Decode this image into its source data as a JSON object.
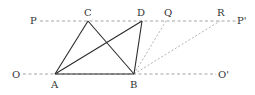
{
  "diagram": {
    "title": "",
    "colors": {
      "solid": "#2b2b2b",
      "dashed": "#9a9a9a",
      "label": "#333333"
    },
    "points": {
      "A": {
        "label": "A",
        "x": 55,
        "y": 74
      },
      "B": {
        "label": "B",
        "x": 134,
        "y": 74
      },
      "C": {
        "label": "C",
        "x": 88,
        "y": 21
      },
      "D": {
        "label": "D",
        "x": 142,
        "y": 21
      },
      "Q": {
        "label": "Q",
        "x": 166,
        "y": 21
      },
      "R": {
        "label": "R",
        "x": 220,
        "y": 21
      }
    },
    "line_labels": {
      "P": "P",
      "P_prime": "P'",
      "O": "O",
      "O_prime": "O'"
    },
    "solid_segments": [
      "AB",
      "AC",
      "CB",
      "AD",
      "DB"
    ],
    "dashed_segments": [
      "PP'",
      "OO'",
      "BQ",
      "BR"
    ]
  }
}
